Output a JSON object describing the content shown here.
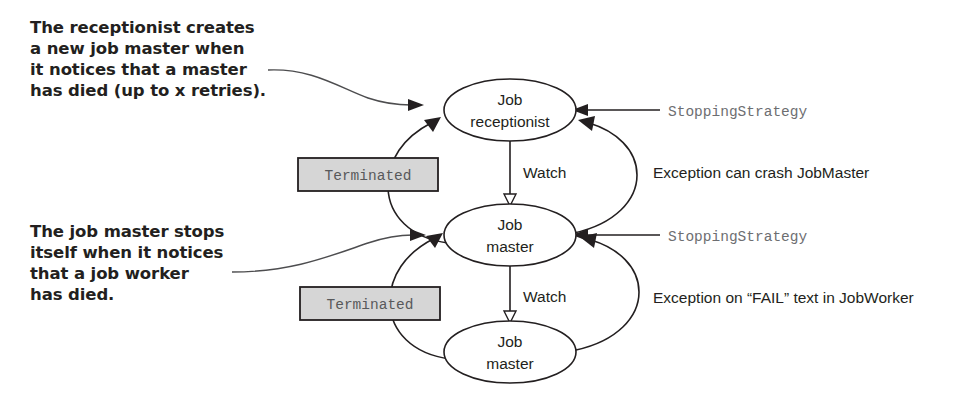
{
  "diagram": {
    "colors": {
      "ink": "#231f20",
      "mono_gray": "#6d6e71",
      "box_fill": "#d6d6d6",
      "background": "#ffffff"
    },
    "annotations": [
      {
        "id": "receptionist-note",
        "lines": [
          "The receptionist creates",
          "a new job master when",
          "it notices that a master",
          "has died (up to x retries)."
        ]
      },
      {
        "id": "job-master-note",
        "lines": [
          "The job master stops",
          "itself when it notices",
          "that a job worker",
          "has died."
        ]
      }
    ],
    "nodes": [
      {
        "id": "job-receptionist",
        "line1": "Job",
        "line2": "receptionist"
      },
      {
        "id": "job-master-middle",
        "line1": "Job",
        "line2": "master"
      },
      {
        "id": "job-master-bottom",
        "line1": "Job",
        "line2": "master"
      }
    ],
    "boxes": [
      {
        "id": "terminated-upper",
        "label": "Terminated"
      },
      {
        "id": "terminated-lower",
        "label": "Terminated"
      }
    ],
    "edge_labels": [
      {
        "id": "watch-upper",
        "label": "Watch"
      },
      {
        "id": "watch-lower",
        "label": "Watch"
      }
    ],
    "side_labels": [
      {
        "id": "stopping-strategy-upper",
        "label": "StoppingStrategy",
        "style": "mono"
      },
      {
        "id": "stopping-strategy-lower",
        "label": "StoppingStrategy",
        "style": "mono"
      },
      {
        "id": "exception-crash-jobmaster",
        "label": "Exception can crash JobMaster",
        "style": "sans"
      },
      {
        "id": "exception-fail-jobworker",
        "label": "Exception on “FAIL” text in JobWorker",
        "style": "sans"
      }
    ]
  }
}
